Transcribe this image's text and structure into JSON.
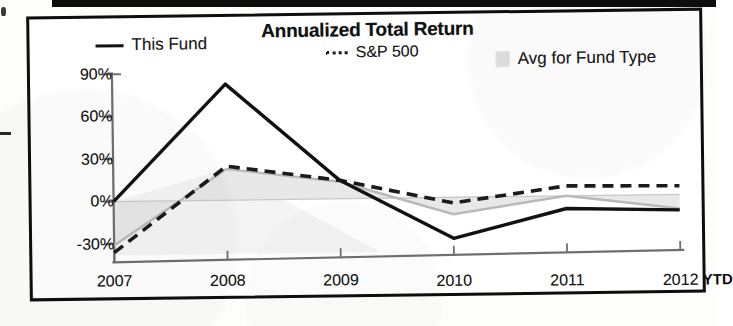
{
  "chart_data": {
    "type": "line",
    "title": "Annualized Total Return",
    "xlabel": "",
    "ylabel": "",
    "ylim": [
      -40,
      90
    ],
    "yticks": [
      90,
      60,
      30,
      0,
      -30
    ],
    "ytick_labels": [
      "90%",
      "60%",
      "30%",
      "0%",
      "-30%"
    ],
    "categories": [
      "2007",
      "2008",
      "2009",
      "2010",
      "2011",
      "2012"
    ],
    "x_axis_note": "YTD",
    "grid": false,
    "legend_position": "top",
    "zero_line": 0,
    "series": [
      {
        "name": "This Fund",
        "style": "solid",
        "color": "#111111",
        "values": [
          0,
          82,
          13,
          -29,
          -9,
          -11
        ]
      },
      {
        "name": "S&P 500",
        "style": "dashed",
        "color": "#1b1b1b",
        "values": [
          -36,
          24,
          13,
          -4,
          7,
          6
        ]
      },
      {
        "name": "Avg for Fund Type",
        "style": "area",
        "color": "#dadada",
        "values": [
          -31,
          22,
          12,
          -12,
          0,
          -10
        ]
      }
    ]
  },
  "legend": {
    "items": [
      {
        "label": "This Fund",
        "marker": "solid-line-swatch"
      },
      {
        "label": "S&P 500",
        "marker": "dashed-line-swatch"
      },
      {
        "label": "Avg for Fund Type",
        "marker": "shaded-area-swatch"
      }
    ]
  },
  "colors": {
    "fund_line": "#111111",
    "benchmark_line": "#1b1b1b",
    "category_area": "#dadada",
    "frame": "#0e0e0e",
    "axis": "#6f6f6f"
  }
}
